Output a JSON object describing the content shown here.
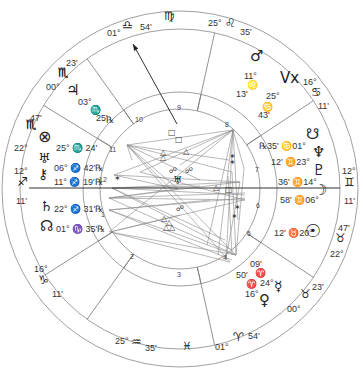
{
  "chart": {
    "center": [
      180,
      189
    ],
    "radii": {
      "outer": 178,
      "zodiac_inner": 160,
      "house_ring_outer": 97,
      "house_ring_inner": 80
    },
    "line_color": "#555555",
    "axis_color": "#333333"
  },
  "signs": [
    {
      "name": "virgo",
      "glyph": "♍",
      "x": 164,
      "y": 22,
      "size": 12
    },
    {
      "name": "pisces",
      "glyph": "♓",
      "x": 182,
      "y": 352,
      "size": 11
    },
    {
      "name": "scorpio-mc-upper",
      "glyph": "♏",
      "x": 58,
      "y": 78,
      "size": 12
    },
    {
      "name": "scorpio-left",
      "glyph": "♏",
      "x": 26,
      "y": 130,
      "size": 12
    }
  ],
  "cusps": [
    {
      "id": "mc",
      "deg": "01°",
      "sign": "♎",
      "min": "54'",
      "deg_pos": [
        107,
        37
      ],
      "sign_pos": [
        122,
        30
      ],
      "min_pos": [
        140,
        31
      ]
    },
    {
      "id": "c9",
      "deg": "25°",
      "sign": "♌",
      "min": "35'",
      "deg_pos": [
        208,
        27
      ],
      "sign_pos": [
        225,
        28
      ],
      "min_pos": [
        240,
        36
      ]
    },
    {
      "id": "c8",
      "deg": "16°",
      "sign": "♋",
      "min": "11'",
      "deg_pos": [
        303,
        86
      ],
      "sign_pos": [
        311,
        97
      ],
      "min_pos": [
        318,
        110
      ]
    },
    {
      "id": "dsc",
      "deg": "12°",
      "sign": "♊",
      "min": "11'",
      "deg_pos": [
        342,
        175
      ],
      "sign_pos": [
        344,
        187
      ],
      "min_pos": [
        344,
        205
      ]
    },
    {
      "id": "c6",
      "deg": "22°",
      "sign": "♉",
      "min": "47'",
      "deg_pos": [
        330,
        258
      ],
      "sign_pos": [
        335,
        243
      ],
      "min_pos": [
        338,
        232
      ]
    },
    {
      "id": "c5",
      "deg": "00°",
      "sign": "♉",
      "min": "23'",
      "deg_pos": [
        287,
        313
      ],
      "sign_pos": [
        300,
        299
      ],
      "min_pos": [
        312,
        291
      ]
    },
    {
      "id": "ic",
      "deg": "01°",
      "sign": "♈",
      "min": "54'",
      "deg_pos": [
        215,
        351
      ],
      "sign_pos": [
        233,
        342
      ],
      "min_pos": [
        248,
        340
      ]
    },
    {
      "id": "c3",
      "deg": "25°",
      "sign": "♒",
      "min": "35'",
      "deg_pos": [
        115,
        345
      ],
      "sign_pos": [
        131,
        347
      ],
      "min_pos": [
        145,
        352
      ]
    },
    {
      "id": "c2",
      "deg": "16°",
      "sign": "♑",
      "min": "11'",
      "deg_pos": [
        34,
        273
      ],
      "sign_pos": [
        38,
        285
      ],
      "min_pos": [
        52,
        298
      ]
    },
    {
      "id": "asc",
      "deg": "12°",
      "sign": "♐",
      "min": "11'",
      "deg_pos": [
        14,
        175
      ],
      "sign_pos": [
        17,
        187
      ],
      "min_pos": [
        16,
        205
      ]
    },
    {
      "id": "c12",
      "deg": "22°",
      "sign": "♏",
      "min": "47'",
      "deg_pos": [
        14,
        152
      ],
      "sign_pos": [
        26,
        130
      ],
      "min_pos": [
        30,
        122
      ]
    },
    {
      "id": "c11",
      "deg": "00°",
      "sign": "♏",
      "min": "23'",
      "deg_pos": [
        46,
        91
      ],
      "sign_pos": [
        58,
        78
      ],
      "min_pos": [
        66,
        67
      ]
    }
  ],
  "planets": [
    {
      "name": "mars",
      "glyph": "♂",
      "x": 250,
      "y": 64,
      "size": 15,
      "text": [
        [
          "11°",
          244,
          80
        ],
        [
          "♌",
          247,
          89
        ],
        [
          "13'",
          236,
          98
        ]
      ]
    },
    {
      "name": "vertex",
      "glyph": "Vx",
      "x": 280,
      "y": 86,
      "size": 15,
      "text": [
        [
          "25°",
          266,
          100
        ],
        [
          "♋",
          262,
          111
        ],
        [
          "43'",
          258,
          119
        ]
      ]
    },
    {
      "name": "south-node",
      "glyph": "☋",
      "x": 306,
      "y": 142,
      "size": 15,
      "text": [
        [
          "℞35' ♋01°",
          259,
          150
        ]
      ]
    },
    {
      "name": "neptune",
      "glyph": "♆",
      "x": 312,
      "y": 160,
      "size": 15,
      "text": [
        [
          "12' ♊23°",
          271,
          166
        ]
      ]
    },
    {
      "name": "pluto",
      "glyph": "♇",
      "x": 312,
      "y": 178,
      "size": 15,
      "text": [
        [
          "36' ♊14°",
          278,
          186
        ]
      ]
    },
    {
      "name": "moon",
      "glyph": "☽",
      "x": 314,
      "y": 198,
      "size": 15,
      "text": [
        [
          "58' ♊06°",
          280,
          204
        ]
      ]
    },
    {
      "name": "sun",
      "glyph": "☉",
      "x": 305,
      "y": 240,
      "size": 18,
      "text": [
        [
          "12' ♉20°",
          274,
          237
        ]
      ]
    },
    {
      "name": "mercury",
      "glyph": "☿",
      "x": 274,
      "y": 293,
      "size": 14,
      "text": [
        [
          "09'",
          250,
          268
        ],
        [
          "♈",
          255,
          277
        ],
        [
          "24°",
          260,
          287
        ]
      ]
    },
    {
      "name": "venus",
      "glyph": "♀",
      "x": 259,
      "y": 308,
      "size": 15,
      "text": [
        [
          "50'",
          236,
          279
        ],
        [
          "♈",
          246,
          288
        ],
        [
          "16°",
          245,
          298
        ]
      ]
    },
    {
      "name": "jupiter",
      "glyph": "♃",
      "x": 66,
      "y": 98,
      "size": 15,
      "text": [
        [
          "03°",
          78,
          106
        ],
        [
          "♏",
          90,
          114
        ],
        [
          "25'",
          96,
          122
        ],
        [
          "℞",
          106,
          124
        ]
      ]
    },
    {
      "name": "part-of-fortune",
      "glyph": "⊗",
      "x": 38,
      "y": 145,
      "size": 16,
      "text": [
        [
          "25° ♏ 24'",
          56,
          152
        ]
      ]
    },
    {
      "name": "uranus",
      "glyph": "♅",
      "x": 38,
      "y": 165,
      "size": 14,
      "text": [
        [
          "06° ♐ 42'℞",
          54,
          172
        ]
      ]
    },
    {
      "name": "chiron",
      "glyph": "⚷",
      "x": 38,
      "y": 181,
      "size": 14,
      "text": [
        [
          "11° ♐ 19'℞",
          54,
          186
        ]
      ]
    },
    {
      "name": "saturn",
      "glyph": "♄",
      "x": 40,
      "y": 213,
      "size": 14,
      "text": [
        [
          "22° ♐ 31'℞",
          54,
          213
        ]
      ]
    },
    {
      "name": "north-node",
      "glyph": "☊",
      "x": 40,
      "y": 234,
      "size": 15,
      "text": [
        [
          "01° ♑ 35'℞",
          56,
          233
        ]
      ]
    }
  ],
  "house_numbers": [
    {
      "n": "1",
      "x": 104,
      "y": 215
    },
    {
      "n": "2",
      "x": 133,
      "y": 257
    },
    {
      "n": "3",
      "x": 180,
      "y": 275
    },
    {
      "n": "4",
      "x": 226,
      "y": 258
    },
    {
      "n": "5",
      "x": 250,
      "y": 234
    },
    {
      "n": "6",
      "x": 259,
      "y": 206
    },
    {
      "n": "7",
      "x": 258,
      "y": 170
    },
    {
      "n": "8",
      "x": 228,
      "y": 125
    },
    {
      "n": "9",
      "x": 180,
      "y": 108
    },
    {
      "n": "10",
      "x": 138,
      "y": 120
    },
    {
      "n": "11",
      "x": 112,
      "y": 150
    },
    {
      "n": "12",
      "x": 102,
      "y": 180
    }
  ],
  "aspect_symbols": [
    {
      "kind": "square",
      "glyph": "□",
      "x": 172,
      "y": 134
    },
    {
      "kind": "square",
      "glyph": "□",
      "x": 179,
      "y": 141
    },
    {
      "kind": "trine",
      "glyph": "△",
      "x": 187,
      "y": 153
    },
    {
      "kind": "trine",
      "glyph": "△",
      "x": 164,
      "y": 154
    },
    {
      "kind": "trine",
      "glyph": "△",
      "x": 164,
      "y": 159
    },
    {
      "kind": "opposition",
      "glyph": "☍",
      "x": 173,
      "y": 172
    },
    {
      "kind": "opposition",
      "glyph": "☍",
      "x": 189,
      "y": 172
    },
    {
      "kind": "sextile",
      "glyph": "✶",
      "x": 233,
      "y": 158
    },
    {
      "kind": "sextile",
      "glyph": "✶",
      "x": 233,
      "y": 164
    },
    {
      "kind": "sextile",
      "glyph": "✶",
      "x": 118,
      "y": 180
    },
    {
      "kind": "trine",
      "glyph": "△",
      "x": 217,
      "y": 189
    },
    {
      "kind": "square",
      "glyph": "□",
      "x": 229,
      "y": 191
    },
    {
      "kind": "opposition",
      "glyph": "☍",
      "x": 180,
      "y": 210
    },
    {
      "kind": "sextile",
      "glyph": "✶",
      "x": 238,
      "y": 209
    },
    {
      "kind": "sextile",
      "glyph": "✶",
      "x": 235,
      "y": 218
    },
    {
      "kind": "trine",
      "glyph": "△",
      "x": 165,
      "y": 220
    },
    {
      "kind": "trine",
      "glyph": "△",
      "x": 170,
      "y": 224
    },
    {
      "kind": "trine",
      "glyph": "△",
      "x": 167,
      "y": 229
    },
    {
      "kind": "trine",
      "glyph": "△",
      "x": 173,
      "y": 229
    }
  ],
  "center_cluster": {
    "glyph": "♅",
    "x": 177,
    "y": 182
  },
  "aspect_lines": [
    [
      127,
      145,
      233,
      130
    ],
    [
      127,
      145,
      232,
      172
    ],
    [
      127,
      145,
      229,
      160
    ],
    [
      127,
      145,
      200,
      180
    ],
    [
      127,
      145,
      178,
      189
    ],
    [
      127,
      145,
      236,
      255
    ],
    [
      127,
      145,
      230,
      262
    ],
    [
      127,
      145,
      132,
      160
    ],
    [
      233,
      130,
      180,
      165
    ],
    [
      233,
      130,
      207,
      245
    ],
    [
      233,
      130,
      218,
      255
    ],
    [
      233,
      130,
      226,
      260
    ],
    [
      233,
      130,
      244,
      168
    ],
    [
      233,
      130,
      109,
      232
    ],
    [
      233,
      130,
      140,
      172
    ],
    [
      233,
      130,
      114,
      175
    ],
    [
      233,
      130,
      238,
      220
    ],
    [
      109,
      198,
      178,
      189
    ],
    [
      109,
      198,
      240,
      182
    ],
    [
      109,
      198,
      245,
      193
    ],
    [
      109,
      198,
      245,
      200
    ],
    [
      109,
      198,
      236,
      255
    ],
    [
      112,
      188,
      240,
      182
    ],
    [
      112,
      188,
      245,
      195
    ],
    [
      112,
      188,
      232,
      250
    ],
    [
      112,
      188,
      200,
      186
    ],
    [
      112,
      188,
      225,
      240
    ],
    [
      109,
      210,
      236,
      255
    ],
    [
      109,
      210,
      232,
      260
    ],
    [
      109,
      210,
      245,
      198
    ],
    [
      109,
      210,
      210,
      200
    ],
    [
      110,
      232,
      236,
      255
    ],
    [
      110,
      232,
      230,
      262
    ],
    [
      110,
      232,
      244,
      200
    ],
    [
      110,
      232,
      180,
      215
    ],
    [
      232,
      172,
      236,
      255
    ],
    [
      228,
      176,
      232,
      255
    ],
    [
      240,
      182,
      226,
      258
    ],
    [
      244,
      168,
      236,
      255
    ],
    [
      114,
      175,
      178,
      189
    ],
    [
      114,
      175,
      240,
      182
    ],
    [
      140,
      172,
      245,
      200
    ]
  ],
  "cusp_lines": [
    {
      "from_r": 80,
      "to_r": 160,
      "angle": 125.5
    },
    {
      "from_r": 80,
      "to_r": 160,
      "angle": 77.5
    },
    {
      "from_r": 80,
      "to_r": 160,
      "angle": 33.5
    },
    {
      "from_r": 80,
      "to_r": 160,
      "angle": 326.5
    },
    {
      "from_r": 80,
      "to_r": 160,
      "angle": 282.5
    },
    {
      "from_r": 80,
      "to_r": 160,
      "angle": 234.5
    },
    {
      "from_r": 80,
      "to_r": 160,
      "angle": 212.5
    },
    {
      "from_r": 80,
      "to_r": 160,
      "angle": 148.5
    }
  ],
  "axes": {
    "asc_dsc": [
      29,
      188,
      340,
      188
    ],
    "mc_arrow": {
      "x1": 177,
      "y1": 124,
      "x2": 133,
      "y2": 44
    }
  }
}
